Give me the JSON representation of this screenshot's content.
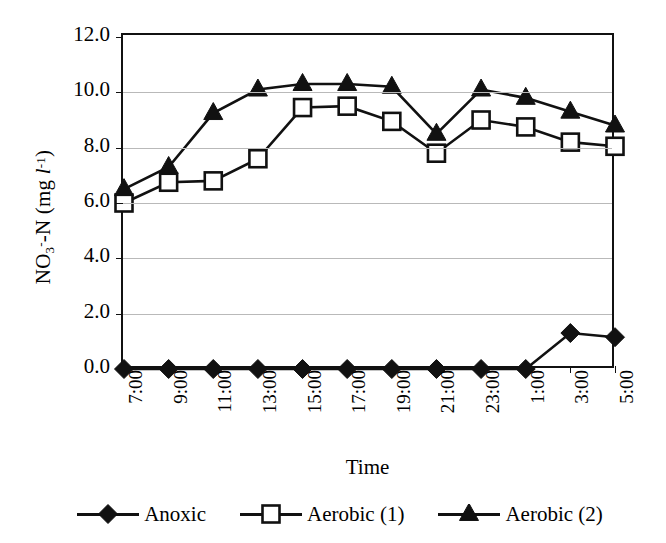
{
  "chart_data": {
    "type": "line",
    "title": "",
    "xlabel": "Time",
    "ylabel": "NO3--N (mg l-1)",
    "ylabel_parts": {
      "prefix": "NO",
      "sub": "3",
      "sup": "-",
      "mid": "-N (mg ",
      "italic": "l",
      "sup2": "-1",
      "suffix": ")"
    },
    "categories": [
      "7:00",
      "9:00",
      "11:00",
      "13:00",
      "15:00",
      "17:00",
      "19:00",
      "21:00",
      "23:00",
      "1:00",
      "3:00",
      "5:00"
    ],
    "ylim": [
      0.0,
      12.0
    ],
    "yticks": [
      "12.0",
      "10.0",
      "8.0",
      "6.0",
      "4.0",
      "2.0",
      "0.0"
    ],
    "ytick_values": [
      12.0,
      10.0,
      8.0,
      6.0,
      4.0,
      2.0,
      0.0
    ],
    "grid": true,
    "legend_position": "bottom",
    "series": [
      {
        "name": "Anoxic",
        "marker": "filled-diamond",
        "color": "#111111",
        "values": [
          0.0,
          0.0,
          0.0,
          0.0,
          0.0,
          0.0,
          0.0,
          0.0,
          0.0,
          0.0,
          1.3,
          1.15
        ]
      },
      {
        "name": "Aerobic (1)",
        "marker": "open-square",
        "color": "#111111",
        "values": [
          6.0,
          6.75,
          6.8,
          7.6,
          9.45,
          9.5,
          8.95,
          7.8,
          9.0,
          8.75,
          8.2,
          8.05
        ]
      },
      {
        "name": "Aerobic (2)",
        "marker": "filled-triangle",
        "color": "#111111",
        "values": [
          6.5,
          7.3,
          9.25,
          10.1,
          10.3,
          10.3,
          10.2,
          8.5,
          10.1,
          9.8,
          9.3,
          8.8
        ]
      }
    ]
  }
}
